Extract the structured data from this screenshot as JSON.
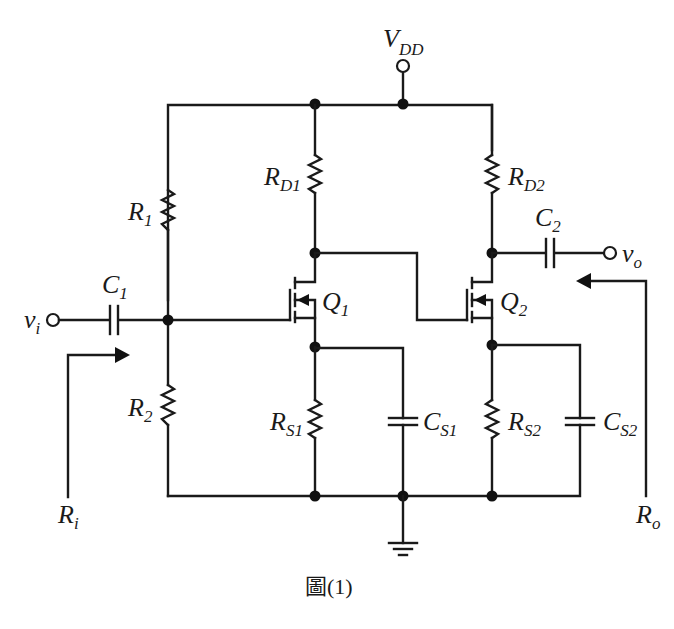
{
  "figure": {
    "caption": "圖(1)",
    "type": "two-stage common-source MOSFET amplifier schematic"
  },
  "labels": {
    "vdd": {
      "main": "V",
      "sub": "DD"
    },
    "r1": {
      "main": "R",
      "sub": "1"
    },
    "r2": {
      "main": "R",
      "sub": "2"
    },
    "rd1": {
      "main": "R",
      "sub": "D1"
    },
    "rd2": {
      "main": "R",
      "sub": "D2"
    },
    "rs1": {
      "main": "R",
      "sub": "S1"
    },
    "rs2": {
      "main": "R",
      "sub": "S2"
    },
    "c1": {
      "main": "C",
      "sub": "1"
    },
    "c2": {
      "main": "C",
      "sub": "2"
    },
    "cs1": {
      "main": "C",
      "sub": "S1"
    },
    "cs2": {
      "main": "C",
      "sub": "S2"
    },
    "q1": {
      "main": "Q",
      "sub": "1"
    },
    "q2": {
      "main": "Q",
      "sub": "2"
    },
    "vi": {
      "main": "v",
      "sub": "i"
    },
    "vo": {
      "main": "v",
      "sub": "o"
    },
    "ri": {
      "main": "R",
      "sub": "i"
    },
    "ro": {
      "main": "R",
      "sub": "o"
    }
  },
  "components": [
    {
      "id": "R1",
      "kind": "resistor",
      "between": [
        "VDD rail",
        "gate node Q1"
      ]
    },
    {
      "id": "R2",
      "kind": "resistor",
      "between": [
        "gate node Q1",
        "ground"
      ]
    },
    {
      "id": "RD1",
      "kind": "resistor",
      "between": [
        "VDD rail",
        "drain Q1"
      ]
    },
    {
      "id": "RD2",
      "kind": "resistor",
      "between": [
        "VDD rail",
        "drain Q2"
      ]
    },
    {
      "id": "RS1",
      "kind": "resistor",
      "between": [
        "source Q1",
        "ground"
      ]
    },
    {
      "id": "RS2",
      "kind": "resistor",
      "between": [
        "source Q2",
        "ground"
      ]
    },
    {
      "id": "C1",
      "kind": "capacitor",
      "between": [
        "vi",
        "gate node Q1"
      ]
    },
    {
      "id": "C2",
      "kind": "capacitor",
      "between": [
        "drain Q2",
        "vo"
      ]
    },
    {
      "id": "CS1",
      "kind": "capacitor",
      "between": [
        "source Q1",
        "ground"
      ]
    },
    {
      "id": "CS2",
      "kind": "capacitor",
      "between": [
        "source Q2",
        "ground"
      ]
    },
    {
      "id": "Q1",
      "kind": "n-channel enhancement MOSFET"
    },
    {
      "id": "Q2",
      "kind": "n-channel enhancement MOSFET",
      "gate": "drain Q1"
    }
  ]
}
